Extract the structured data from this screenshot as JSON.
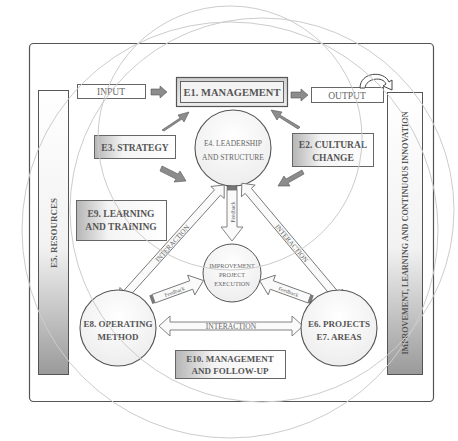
{
  "diagram": {
    "input_label": "INPUT",
    "output_label": "OUTPUT",
    "e1": "E1. MANAGEMENT",
    "e2_line1": "E2. CULTURAL",
    "e2_line2": "CHANGE",
    "e3": "E3. STRATEGY",
    "e4_line1": "E4. LEADERSHIP",
    "e4_line2": "AND STRUCTURE",
    "e5": "E5. RESOURCES",
    "e6_line1": "E6. PROJECTS",
    "e7_line2": "E7. AREAS",
    "e8_line1": "E8. OPERATING",
    "e8_line2": "METHOD",
    "e9_line1": "E9. LEARNING",
    "e9_line2": "AND TRAINING",
    "e10_line1": "E10. MANAGEMENT",
    "e10_line2": "AND FOLLOW-UP",
    "center_line1": "IMPROVEMENT",
    "center_line2": "PROJECT",
    "center_line3": "EXECUTION",
    "right_bar": "IMPROVEMENT, LEARNING AND CONTINUOUS INNOVATION",
    "interaction_left": "INTERACTION",
    "interaction_right": "INTERACTION",
    "interaction_bottom": "INTERACTION",
    "feedback_top": "Feedback",
    "feedback_left": "Feedback",
    "feedback_right": "Feedback"
  },
  "colors": {
    "frame": "#555555",
    "arrow_fill": "#8c8c8c",
    "outline_arrow": "#777777",
    "orbit": "#cfcfcf",
    "shade": "#bdbdbd"
  }
}
